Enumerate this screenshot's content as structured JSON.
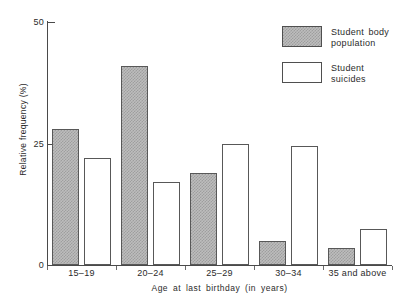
{
  "chart_data": {
    "type": "bar",
    "title": "",
    "xlabel": "Age at last birthday (in years)",
    "ylabel": "Relative frequency (%)",
    "categories": [
      "15–19",
      "20–24",
      "25–29",
      "30–34",
      "35 and above"
    ],
    "series": [
      {
        "name": "Student body population",
        "values": [
          28,
          41,
          19,
          5,
          3.5
        ],
        "color": "#bdbdbd",
        "pattern": "checkered-gray"
      },
      {
        "name": "Student suicides",
        "values": [
          22,
          17,
          25,
          24.5,
          7.5
        ],
        "color": "#ffffff",
        "pattern": "solid-white"
      }
    ],
    "ylim": [
      0,
      50
    ],
    "yticks": [
      0,
      25,
      50
    ],
    "ytick_labels": [
      "0",
      "25",
      "50"
    ],
    "grid": false,
    "legend_position": "top-right"
  },
  "axes": {
    "y_title": "Relative frequency (%)",
    "x_title": "Age at last birthday (in years)",
    "y_ticks": [
      {
        "value": 50,
        "label": "50"
      },
      {
        "value": 25,
        "label": "25"
      },
      {
        "value": 0,
        "label": "0"
      }
    ],
    "x_categories": [
      {
        "label": "15–19"
      },
      {
        "label": "20–24"
      },
      {
        "label": "25–29"
      },
      {
        "label": "30–34"
      },
      {
        "label": "35 and above"
      }
    ]
  },
  "legend": {
    "entries": [
      {
        "label_line1": "Student body",
        "label_line2": "population",
        "swatch": "hatched-gray"
      },
      {
        "label_line1": "Student suicides",
        "label_line2": "",
        "swatch": "white-outline"
      }
    ]
  },
  "colors": {
    "ink": "#2b2b2b",
    "axis": "#4a4a4a",
    "bar_fill_shaded": "#bdbdbd",
    "bar_fill_open": "#ffffff",
    "bar_border": "#585858",
    "background": "#ffffff"
  }
}
